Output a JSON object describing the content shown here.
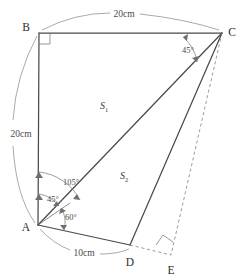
{
  "figure": {
    "type": "geometry-diagram",
    "background_color": "#ffffff",
    "line_color": "#4a4a4a",
    "dashed_color": "#8a8a8a",
    "annotation_color": "#7d7d7d"
  },
  "vertices": {
    "A": {
      "label": "A",
      "x": 38,
      "y": 225,
      "label_x": 28,
      "label_y": 230
    },
    "B": {
      "label": "B",
      "x": 39,
      "y": 33,
      "label_x": 26,
      "label_y": 30
    },
    "C": {
      "label": "C",
      "x": 222,
      "y": 33,
      "label_x": 228,
      "label_y": 31
    },
    "D": {
      "label": "D",
      "x": 130,
      "y": 245,
      "label_x": 126,
      "label_y": 262
    },
    "E": {
      "label": "E",
      "x": 171,
      "y": 255,
      "label_x": 164,
      "label_y": 272
    }
  },
  "edges": [
    {
      "name": "edge-BC",
      "from": "B",
      "to": "C",
      "style": "solid"
    },
    {
      "name": "edge-BA",
      "from": "B",
      "to": "A",
      "style": "solid"
    },
    {
      "name": "edge-AC",
      "from": "A",
      "to": "C",
      "style": "solid"
    },
    {
      "name": "edge-AD",
      "from": "A",
      "to": "D",
      "style": "solid"
    },
    {
      "name": "edge-DC",
      "from": "D",
      "to": "C",
      "style": "solid"
    },
    {
      "name": "edge-CE",
      "from": "C",
      "to": "E",
      "style": "dashed"
    },
    {
      "name": "edge-DE",
      "from": "D",
      "to": "E",
      "style": "dashed"
    }
  ],
  "dimensions": [
    {
      "name": "dimension-BC",
      "text": "20cm",
      "label_x": 123,
      "label_y": 17
    },
    {
      "name": "dimension-BA",
      "text": "20cm",
      "label_x": 22,
      "label_y": 133
    },
    {
      "name": "dimension-AD",
      "text": "10cm",
      "label_x": 82,
      "label_y": 252
    }
  ],
  "angles": [
    {
      "name": "angle-at-C",
      "text": "45°",
      "label_x": 188,
      "label_y": 53
    },
    {
      "name": "angle-BAC",
      "text": "105°",
      "label_x": 70,
      "label_y": 184
    },
    {
      "name": "angle-BA-tick",
      "text": "45°",
      "label_x": 52,
      "label_y": 201
    },
    {
      "name": "angle-tick-AD",
      "text": "60°",
      "label_x": 70,
      "label_y": 219
    }
  ],
  "right_angles": [
    {
      "name": "right-angle-B",
      "x": 39,
      "y": 33
    },
    {
      "name": "right-angle-E",
      "x": 171,
      "y": 255
    }
  ],
  "regions": [
    {
      "name": "region-label-s1",
      "symbol": "S",
      "subscript": "1",
      "x": 106,
      "y": 106
    },
    {
      "name": "region-label-s2",
      "symbol": "S",
      "subscript": "2",
      "x": 126,
      "y": 176
    }
  ]
}
